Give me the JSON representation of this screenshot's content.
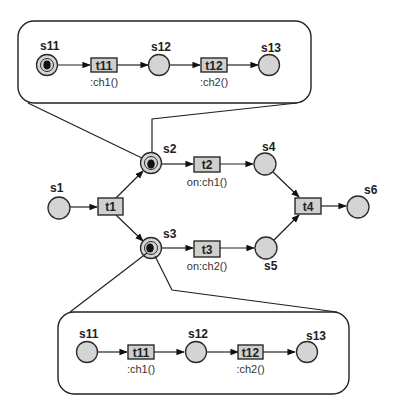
{
  "diagram": {
    "type": "petri-net",
    "main_net": {
      "places": [
        {
          "id": "s1",
          "label": "s1",
          "cx": 59,
          "cy": 208,
          "marked": false
        },
        {
          "id": "s2",
          "label": "s2",
          "cx": 151,
          "cy": 163,
          "marked": true
        },
        {
          "id": "s3",
          "label": "s3",
          "cx": 151,
          "cy": 248,
          "marked": true
        },
        {
          "id": "s4",
          "label": "s4",
          "cx": 265,
          "cy": 164,
          "marked": false
        },
        {
          "id": "s5",
          "label": "s5",
          "cx": 266,
          "cy": 248,
          "marked": false
        },
        {
          "id": "s6",
          "label": "s6",
          "cx": 358,
          "cy": 208,
          "marked": false
        }
      ],
      "transitions": [
        {
          "id": "t1",
          "label": "t1",
          "annotation": ""
        },
        {
          "id": "t2",
          "label": "t2",
          "annotation": "on:ch1()"
        },
        {
          "id": "t3",
          "label": "t3",
          "annotation": "on:ch2()"
        },
        {
          "id": "t4",
          "label": "t4",
          "annotation": ""
        }
      ],
      "arcs": [
        [
          "s1",
          "t1"
        ],
        [
          "t1",
          "s2"
        ],
        [
          "t1",
          "s3"
        ],
        [
          "s2",
          "t2"
        ],
        [
          "t2",
          "s4"
        ],
        [
          "s3",
          "t3"
        ],
        [
          "t3",
          "s5"
        ],
        [
          "s4",
          "t4"
        ],
        [
          "s5",
          "t4"
        ],
        [
          "t4",
          "s6"
        ]
      ]
    },
    "subnet_top": {
      "refines": "s2",
      "places": [
        {
          "id": "s11",
          "label": "s11",
          "marked": true
        },
        {
          "id": "s12",
          "label": "s12",
          "marked": false
        },
        {
          "id": "s13",
          "label": "s13",
          "marked": false
        }
      ],
      "transitions": [
        {
          "id": "t11",
          "label": "t11",
          "annotation": ":ch1()"
        },
        {
          "id": "t12",
          "label": "t12",
          "annotation": ":ch2()"
        }
      ]
    },
    "subnet_bottom": {
      "refines": "s3",
      "places": [
        {
          "id": "s11",
          "label": "s11",
          "marked": false
        },
        {
          "id": "s12",
          "label": "s12",
          "marked": false
        },
        {
          "id": "s13",
          "label": "s13",
          "marked": false
        }
      ],
      "transitions": [
        {
          "id": "t11",
          "label": "t11",
          "annotation": ":ch1()"
        },
        {
          "id": "t12",
          "label": "t12",
          "annotation": ":ch2()"
        }
      ]
    }
  },
  "labels": {
    "s1": "s1",
    "s2": "s2",
    "s3": "s3",
    "s4": "s4",
    "s5": "s5",
    "s6": "s6",
    "t1": "t1",
    "t2": "t2",
    "t3": "t3",
    "t4": "t4",
    "t2_annot": "on:ch1()",
    "t3_annot": "on:ch2()",
    "top": {
      "s11": "s11",
      "s12": "s12",
      "s13": "s13",
      "t11": "t11",
      "t12": "t12",
      "t11_annot": ":ch1()",
      "t12_annot": ":ch2()"
    },
    "bottom": {
      "s11": "s11",
      "s12": "s12",
      "s13": "s13",
      "t11": "t11",
      "t12": "t12",
      "t11_annot": ":ch1()",
      "t12_annot": ":ch2()"
    }
  },
  "colors": {
    "place_fill": "#d4d4d4",
    "transition_fill": "#cfcfcf",
    "stroke": "#222222",
    "token": "#111111",
    "background": "#ffffff"
  }
}
